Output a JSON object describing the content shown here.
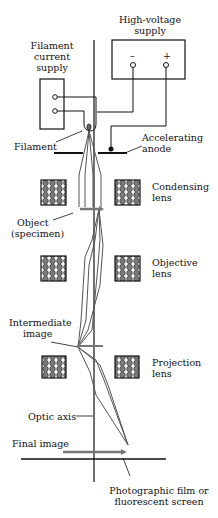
{
  "labels": {
    "high_voltage_supply_1": "High-voltage",
    "high_voltage_supply_2": "supply",
    "minus": "–",
    "plus": "+",
    "filament_supply_1": "Filament",
    "filament_supply_2": "current",
    "filament_supply_3": "supply",
    "filament": "Filament",
    "accelerating_1": "Accelerating",
    "accelerating_2": "anode",
    "condensing_1": "Condensing",
    "condensing_2": "lens",
    "object_1": "Object",
    "object_2": "(specimen)",
    "objective_1": "Objective",
    "objective_2": "lens",
    "intermediate_1": "Intermediate",
    "intermediate_2": "image",
    "projection_1": "Projection",
    "projection_2": "lens",
    "optic_axis": "Optic axis",
    "final_image": "Final image",
    "screen_1": "Photographic film or",
    "screen_2": "fluorescent screen"
  },
  "colors": {
    "line": "#111111",
    "ray": "#555555",
    "arrow": "#777777",
    "coil_fill": "#888888"
  }
}
